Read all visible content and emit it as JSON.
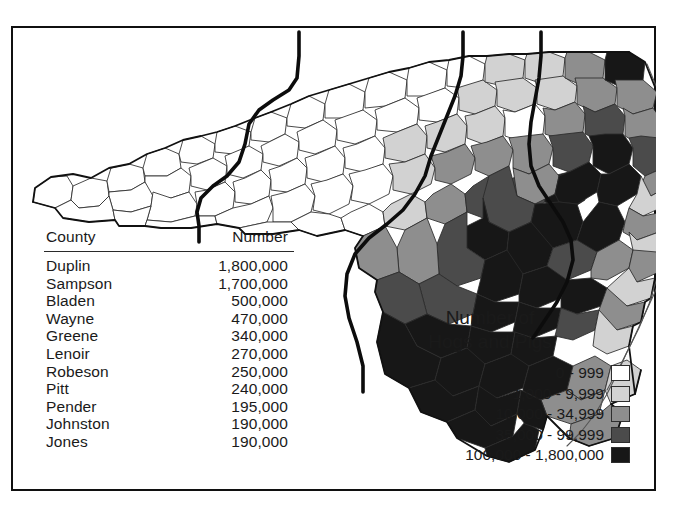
{
  "figure": {
    "kind": "choropleth-map",
    "region": "North Carolina",
    "frame_color": "#101010",
    "background": "#ffffff"
  },
  "table": {
    "name": "top-hog-counties-table",
    "columns": [
      "County",
      "Number"
    ],
    "rows": [
      {
        "county": "Duplin",
        "number": "1,800,000",
        "value": 1800000
      },
      {
        "county": "Sampson",
        "number": "1,700,000",
        "value": 1700000
      },
      {
        "county": "Bladen",
        "number": "500,000",
        "value": 500000
      },
      {
        "county": "Wayne",
        "number": "470,000",
        "value": 470000
      },
      {
        "county": "Greene",
        "number": "340,000",
        "value": 340000
      },
      {
        "county": "Lenoir",
        "number": "270,000",
        "value": 270000
      },
      {
        "county": "Robeson",
        "number": "250,000",
        "value": 250000
      },
      {
        "county": "Pitt",
        "number": "240,000",
        "value": 240000
      },
      {
        "county": "Pender",
        "number": "195,000",
        "value": 195000
      },
      {
        "county": "Johnston",
        "number": "190,000",
        "value": 190000
      },
      {
        "county": "Jones",
        "number": "190,000",
        "value": 190000
      }
    ]
  },
  "legend": {
    "title_line1": "Number of",
    "title_line2": "Hogs and Pigs",
    "classes": [
      {
        "label": "0 - 999",
        "color": "#ffffff",
        "min": 0,
        "max": 999
      },
      {
        "label": "1,000 - 9,999",
        "color": "#d2d2d2",
        "min": 1000,
        "max": 9999
      },
      {
        "label": "10,000 - 34,999",
        "color": "#8e8e8e",
        "min": 10000,
        "max": 34999
      },
      {
        "label": "35,000 - 99,999",
        "color": "#4b4b4b",
        "min": 35000,
        "max": 99999
      },
      {
        "label": "100,000 - 1,800,000",
        "color": "#171717",
        "min": 100000,
        "max": 1800000
      }
    ]
  },
  "chart_data": {
    "type": "map",
    "title": "Number of Hogs and Pigs",
    "map_region": "North Carolina counties",
    "classification": "graduated-gray-choropleth",
    "class_breaks": [
      0,
      1000,
      10000,
      35000,
      100000,
      1800000
    ],
    "class_colors": [
      "#ffffff",
      "#d2d2d2",
      "#8e8e8e",
      "#4b4b4b",
      "#171717"
    ],
    "class_labels": [
      "0 - 999",
      "1,000 - 9,999",
      "10,000 - 34,999",
      "35,000 - 99,999",
      "100,000 - 1,800,000"
    ],
    "table": {
      "columns": [
        "County",
        "Number"
      ],
      "categories": [
        "Duplin",
        "Sampson",
        "Bladen",
        "Wayne",
        "Greene",
        "Lenoir",
        "Robeson",
        "Pitt",
        "Pender",
        "Johnston",
        "Jones"
      ],
      "values": [
        1800000,
        1700000,
        500000,
        470000,
        340000,
        270000,
        250000,
        240000,
        195000,
        190000,
        190000
      ]
    },
    "spatial_pattern": "Western counties are unshaded (0-999); shading darkens steadily eastward, with the darkest class (100,000-1,800,000) concentrated in the southeastern coastal plain.",
    "annotations": [
      "thick regional boundary lines divide the state into districts"
    ]
  }
}
